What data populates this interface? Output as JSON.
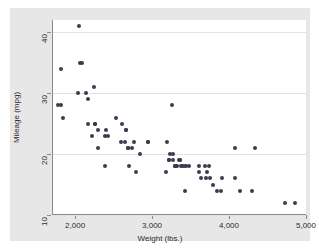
{
  "chart_data": {
    "type": "scatter",
    "title": "",
    "xlabel": "Weight (lbs.)",
    "ylabel": "Mileage (mpg)",
    "xlim": [
      1700,
      5000
    ],
    "ylim": [
      10,
      42
    ],
    "grid": true,
    "legend": "none",
    "marker_color": "#3b3b4f",
    "xticks": [
      {
        "value": 2000,
        "label": "2,000"
      },
      {
        "value": 3000,
        "label": "3,000"
      },
      {
        "value": 4000,
        "label": "4,000"
      },
      {
        "value": 5000,
        "label": "5,000"
      }
    ],
    "yticks": [
      {
        "value": 10,
        "label": "10"
      },
      {
        "value": 20,
        "label": "20"
      },
      {
        "value": 30,
        "label": "30"
      },
      {
        "value": 40,
        "label": "40"
      }
    ],
    "x": [
      2040,
      2050,
      1800,
      1760,
      1800,
      1830,
      2020,
      2070,
      2130,
      2160,
      2160,
      2200,
      2230,
      2240,
      2240,
      2280,
      2290,
      2370,
      2380,
      2390,
      2410,
      2520,
      2580,
      2600,
      2640,
      2650,
      2650,
      2670,
      2670,
      2690,
      2730,
      2750,
      2780,
      2830,
      2930,
      2930,
      3170,
      3180,
      3200,
      3210,
      3220,
      3250,
      3260,
      3260,
      3280,
      3280,
      3300,
      3310,
      3330,
      3350,
      3350,
      3360,
      3370,
      3400,
      3420,
      3430,
      3470,
      3600,
      3600,
      3620,
      3670,
      3690,
      3700,
      3730,
      3740,
      3780,
      3830,
      3880,
      3900,
      4060,
      4070,
      4130,
      4290,
      4330,
      4720,
      4840
    ],
    "y": [
      41,
      35,
      34,
      28,
      28,
      26,
      30,
      35,
      30,
      29,
      25,
      23,
      31,
      25,
      25,
      24,
      21,
      23,
      18,
      24,
      23,
      26,
      22,
      25,
      22,
      24,
      24,
      21,
      21,
      18,
      21,
      22,
      17,
      20,
      22,
      22,
      17,
      22,
      19,
      19,
      20,
      28,
      19,
      20,
      18,
      18,
      18,
      18,
      19,
      19,
      19,
      18,
      18,
      18,
      14,
      18,
      18,
      18,
      17,
      16,
      18,
      16,
      17,
      18,
      16,
      15,
      14,
      14,
      16,
      21,
      16,
      14,
      14,
      21,
      12,
      12
    ]
  },
  "axes": {
    "y_title": "Mileage (mpg)",
    "x_title": "Weight (lbs.)"
  }
}
